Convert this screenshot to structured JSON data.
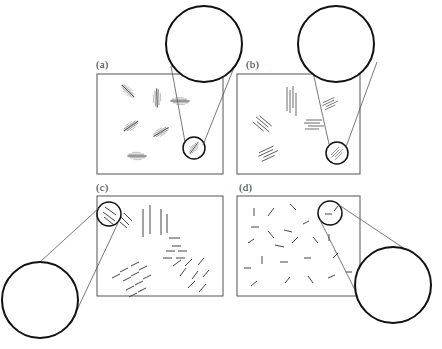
{
  "figure": {
    "colors": {
      "line": "#444444",
      "circle": "#111111",
      "background": "#ffffff"
    },
    "panels": [
      {
        "id": "a",
        "label": "(a)",
        "box": [
          97,
          74,
          126,
          100
        ],
        "state": "bundled aligned chains with coiled segments (shish-kebab-like clusters)",
        "small_circle": [
          194,
          148,
          11
        ],
        "big_circle": [
          204,
          44,
          38
        ]
      },
      {
        "id": "b",
        "label": "(b)",
        "box": [
          237,
          74,
          123,
          100
        ],
        "state": "groups of parallel extended chains",
        "small_circle": [
          337,
          153,
          11
        ],
        "big_circle": [
          336,
          44,
          38
        ]
      },
      {
        "id": "c",
        "label": "(c)",
        "box": [
          97,
          196,
          126,
          100
        ],
        "state": "short parallel rod segments in oriented domains",
        "small_circle": [
          109,
          214,
          12
        ],
        "big_circle": [
          40,
          300,
          38
        ]
      },
      {
        "id": "d",
        "label": "(d)",
        "box": [
          237,
          196,
          123,
          100
        ],
        "state": "randomly oriented short rods",
        "small_circle": [
          330,
          213,
          12
        ],
        "big_circle": [
          393,
          285,
          38
        ]
      }
    ]
  }
}
